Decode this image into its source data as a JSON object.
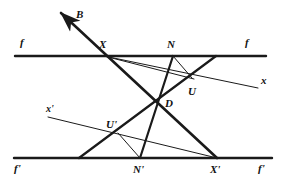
{
  "figure": {
    "type": "geometry-diagram",
    "width": 290,
    "height": 186,
    "background_color": "#ffffff",
    "stroke_color": "#1a1a1a",
    "labels": {
      "b": "B",
      "f_left": "f",
      "f_right": "f",
      "f_prime_left": "f'",
      "f_prime_right": "f'",
      "x_right": "x",
      "x_prime_left": "x'",
      "point_X": "X",
      "point_N": "N",
      "point_U": "U",
      "point_D": "D",
      "point_U_prime": "U'",
      "point_N_prime": "N'",
      "point_X_prime": "X'"
    },
    "points": {
      "X": [
        104,
        56
      ],
      "N": [
        173,
        56
      ],
      "T": [
        216,
        56
      ],
      "U": [
        192,
        78
      ],
      "D": [
        156,
        102
      ],
      "U_prime": [
        118,
        133
      ],
      "N_prime": [
        140,
        158
      ],
      "X_prime": [
        217,
        158
      ],
      "L_prime": [
        79,
        158
      ],
      "arrow_tip": [
        56,
        9
      ]
    },
    "lines": {
      "f": {
        "y": 56,
        "x_start": 15,
        "x_end": 266,
        "weight": "thick"
      },
      "f_prime": {
        "y": 158,
        "x_start": 14,
        "x_end": 272,
        "weight": "thick"
      },
      "x": {
        "from": [
          104,
          56
        ],
        "to": [
          258,
          88
        ],
        "weight": "thin"
      },
      "x_prime": {
        "from": [
          48,
          117
        ],
        "to": [
          217,
          158
        ],
        "weight": "thin"
      },
      "B_ray": {
        "from": [
          217,
          158
        ],
        "to": [
          56,
          9
        ],
        "weight": "thick",
        "arrow": true
      },
      "X_to_X_prime": {
        "from": [
          104,
          56
        ],
        "to": [
          217,
          158
        ],
        "weight": "thick"
      },
      "N_to_N_prime": {
        "from": [
          173,
          56
        ],
        "to": [
          140,
          158
        ],
        "weight": "thick"
      },
      "D_to_T": {
        "from": [
          156,
          102
        ],
        "to": [
          216,
          56
        ],
        "weight": "thick"
      },
      "N_to_U": {
        "from": [
          173,
          56
        ],
        "to": [
          192,
          78
        ],
        "weight": "thin"
      },
      "U_prime_to_N_prime": {
        "from": [
          118,
          133
        ],
        "to": [
          140,
          158
        ],
        "weight": "thin"
      },
      "U_prime_to_L_prime": {
        "from": [
          118,
          133
        ],
        "to": [
          79,
          158
        ],
        "weight": "thick"
      },
      "X_to_U": {
        "from": [
          104,
          56
        ],
        "to": [
          192,
          78
        ],
        "weight": "thin"
      }
    }
  }
}
